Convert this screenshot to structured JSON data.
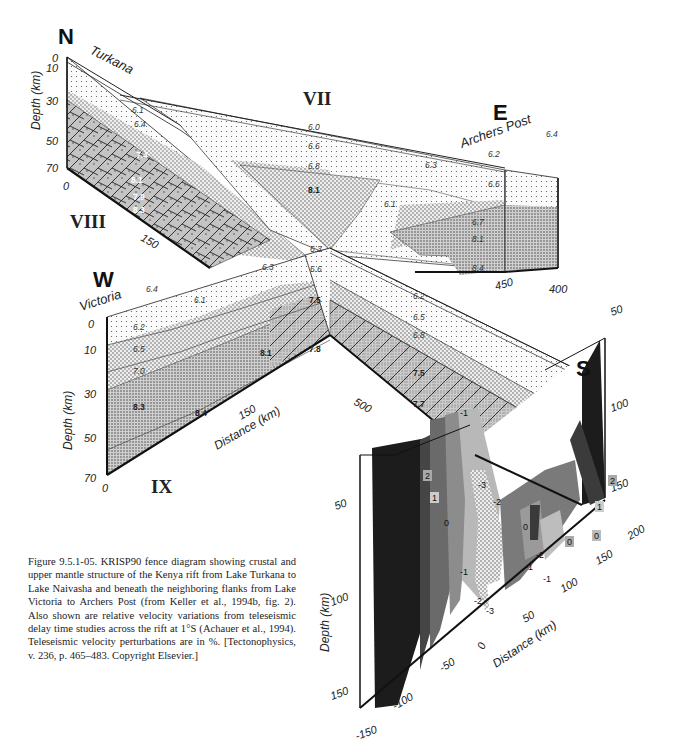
{
  "figure": {
    "directions": {
      "north": "N",
      "east": "E",
      "west": "W",
      "south": "S"
    },
    "profiles": {
      "vii": "VII",
      "viii": "VIII",
      "ix": "IX"
    },
    "places": {
      "turkana": "Turkana",
      "archers_post": "Archers Post",
      "victoria": "Victoria"
    },
    "profile_viii": {
      "depth_axis_label": "Depth (km)",
      "depth_ticks": [
        "0",
        "10",
        "30",
        "50",
        "70"
      ],
      "distance_ticks": [
        "0",
        "150"
      ],
      "velocities": [
        "6.1",
        "6.4",
        "7.4",
        "8.1",
        "7.9",
        "8.3"
      ]
    },
    "profile_vii": {
      "velocities": [
        "6.0",
        "6.6",
        "6.8",
        "8.1",
        "6.3",
        "6.1",
        "6.2",
        "6.6",
        "6.7",
        "8.1",
        "8.4",
        "6.4"
      ],
      "distance_ticks": [
        "450",
        "400"
      ]
    },
    "profile_ix": {
      "depth_axis_label": "Depth (km)",
      "depth_ticks": [
        "0",
        "10",
        "30",
        "50",
        "70"
      ],
      "distance_axis_label": "Distance (km)",
      "distance_ticks": [
        "0",
        "150",
        "500"
      ],
      "velocities": [
        "6.4",
        "6.1",
        "6.2",
        "6.5",
        "7.0",
        "8.1",
        "8.3",
        "8.4",
        "6.3",
        "6.3",
        "6.6",
        "7.5",
        "7.8",
        "6.2",
        "6.5",
        "6.8",
        "7.5",
        "7.7"
      ]
    },
    "teleseismic_panel": {
      "depth_axis_label": "Depth (km)",
      "depth_ticks_left": [
        "50",
        "100",
        "150"
      ],
      "depth_ticks_right": [
        "50",
        "100",
        "150"
      ],
      "distance_axis_label": "Distance (km)",
      "distance_ticks": [
        "-150",
        "-100",
        "-50",
        "0",
        "50",
        "100",
        "150",
        "200"
      ],
      "contour_labels": [
        "2",
        "1",
        "0",
        "-1",
        "-3",
        "-2",
        "0",
        "-2",
        "-1",
        "-1",
        "-2",
        "-3",
        "0",
        "0",
        "1",
        "2",
        "-1"
      ]
    }
  },
  "caption": {
    "text": "Figure 9.5.1-05. KRISP90 fence diagram showing crustal and upper mantle structure of the Kenya rift from Lake Turkana to Lake Naivasha and beneath the neighboring flanks from Lake Victoria to Archers Post (from Keller et al., 1994b, fig. 2). Also shown are relative velocity variations from teleseismic delay time studies across the rift at 1°S (Achauer et al., 1994). Teleseismic velocity perturbations are in %. [Tectonophysics, v. 236, p. 465–483. Copyright Elsevier.]"
  }
}
